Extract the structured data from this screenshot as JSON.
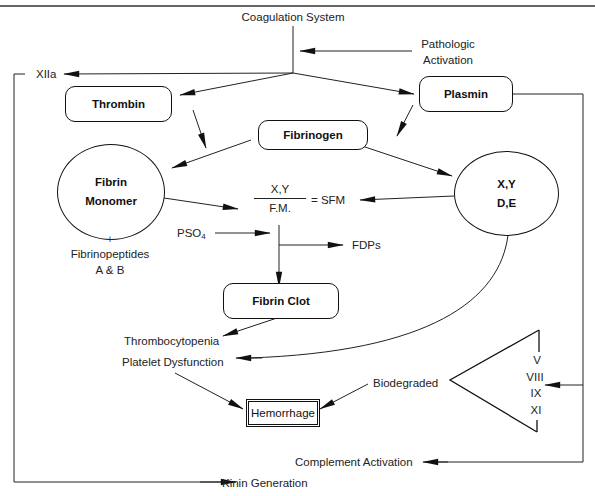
{
  "figure": {
    "top_rule": true,
    "title_text": "Coagulation System"
  },
  "labels": {
    "coagulation_system": "Coagulation System",
    "pathologic_activation_line1": "Pathologic",
    "pathologic_activation_line2": "Activation",
    "xiia": "XIIa",
    "plus": "+",
    "fibrinopeptides_line1": "Fibrinopeptides",
    "fibrinopeptides_line2": "A & B",
    "pso4_base": "PSO",
    "pso4_sub": "4",
    "fdps": "FDPs",
    "thrombocytopenia": "Thrombocytopenia",
    "platelet_dysfunction": "Platelet Dysfunction",
    "biodegraded": "Biodegraded",
    "complement_activation": "Complement Activation",
    "kinin_generation": "Kinin Generation",
    "sfm_equation": "= SFM"
  },
  "nodes": {
    "thrombin": "Thrombin",
    "plasmin": "Plasmin",
    "fibrinogen": "Fibrinogen",
    "fibrin_monomer_line1": "Fibrin",
    "fibrin_monomer_line2": "Monomer",
    "degradation_products_line1": "X,Y",
    "degradation_products_line2": "D,E",
    "fibrin_clot": "Fibrin Clot",
    "hemorrhage": "Hemorrhage"
  },
  "fraction": {
    "numerator": "X,Y",
    "denominator": "F.M."
  },
  "factors": [
    "V",
    "VIII",
    "IX",
    "XI"
  ],
  "edges": [
    {
      "from": "Coagulation System",
      "to": "XIIa"
    },
    {
      "from": "Coagulation System",
      "to": "Thrombin"
    },
    {
      "from": "Coagulation System",
      "to": "Plasmin"
    },
    {
      "from": "Pathologic Activation",
      "to": "Coagulation System"
    },
    {
      "from": "Thrombin",
      "to": "Fibrin Monomer"
    },
    {
      "from": "Fibrinogen",
      "to": "Fibrin Monomer"
    },
    {
      "from": "Plasmin",
      "to": "Fibrinogen"
    },
    {
      "from": "Fibrinogen",
      "to": "X,Y D,E"
    },
    {
      "from": "Fibrin Monomer",
      "to": "SFM"
    },
    {
      "from": "X,Y D,E",
      "to": "SFM"
    },
    {
      "from": "PSO4",
      "to": "SFM"
    },
    {
      "from": "SFM",
      "to": "FDPs"
    },
    {
      "from": "SFM",
      "to": "Fibrin Clot"
    },
    {
      "from": "Fibrin Clot",
      "to": "Thrombocytopenia"
    },
    {
      "from": "X,Y D,E",
      "to": "Platelet Dysfunction"
    },
    {
      "from": "Platelet Dysfunction",
      "to": "Hemorrhage"
    },
    {
      "from": "Biodegraded",
      "to": "Hemorrhage"
    },
    {
      "from": "Plasmin",
      "to": "Factors V VIII IX XI"
    },
    {
      "from": "Plasmin",
      "to": "Complement Activation"
    },
    {
      "from": "XIIa",
      "to": "Kinin Generation"
    }
  ],
  "colors": {
    "ink": "#111111",
    "text": "#222222",
    "background": "#ffffff"
  }
}
